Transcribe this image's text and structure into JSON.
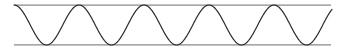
{
  "figure": {
    "name": "sinusoidal-waveform-diagram",
    "width": 343,
    "height": 53,
    "background_color": "#ffffff"
  },
  "chart_data": {
    "type": "line",
    "title": "",
    "subtitle": "",
    "xlabel": "",
    "ylabel": "",
    "grid": false,
    "legend": null,
    "axis_visible": false,
    "tick_labels_x": [],
    "tick_labels_y": [],
    "xlim": [
      14,
      332
    ],
    "ylim": [
      5,
      45
    ],
    "series": [
      {
        "name": "sine-wave",
        "color": "#2b2b2b",
        "stroke_width": 1.2,
        "cycles": 5,
        "period_px": 65,
        "amplitude_px": 20,
        "midline_y": 25,
        "start_x": 14,
        "end_x": 332,
        "start_phase": "descending-from-crest",
        "crest_x": [
          72,
          137,
          202,
          267,
          332
        ],
        "trough_x": [
          40,
          105,
          170,
          235,
          300
        ],
        "crest_y": 5,
        "trough_y": 45
      }
    ],
    "annotations": [
      {
        "name": "upper-envelope-line",
        "type": "horizontal-line",
        "y": 5,
        "x_start": 14,
        "x_end": 331,
        "color": "#8a8a8a",
        "stroke_width": 1.2
      },
      {
        "name": "lower-envelope-line",
        "type": "horizontal-line",
        "y": 45,
        "x_start": 14,
        "x_end": 331,
        "color": "#8a8a8a",
        "stroke_width": 1.2
      }
    ]
  }
}
